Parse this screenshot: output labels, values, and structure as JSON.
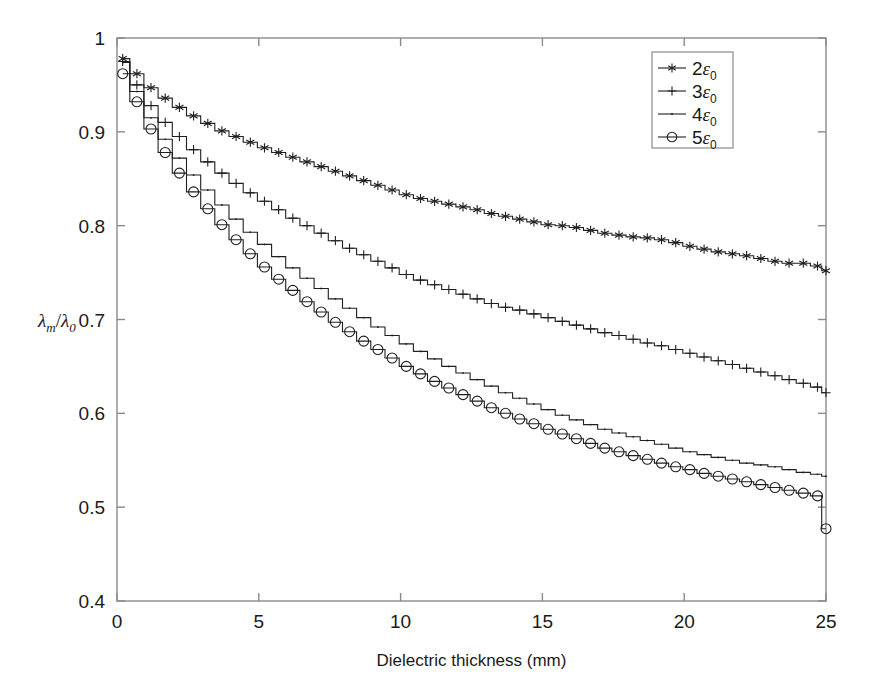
{
  "chart_data": {
    "type": "line",
    "title": "",
    "subtitle": "",
    "xlabel": "Dielectric thickness (mm)",
    "ylabel": "λₘ/λ₀",
    "ylabel_parts": {
      "lambda": "λ",
      "sub_m": "m",
      "slash": "/",
      "sub_0": "0"
    },
    "xlim": [
      0,
      25
    ],
    "ylim": [
      0.4,
      1.0
    ],
    "xticks": [
      0,
      5,
      10,
      15,
      20,
      25
    ],
    "xticklabels": [
      "0",
      "5",
      "10",
      "15",
      "20",
      "25"
    ],
    "yticks": [
      0.4,
      0.5,
      0.6,
      0.7,
      0.8,
      0.9,
      1.0
    ],
    "yticklabels": [
      "0.4",
      "0.5",
      "0.6",
      "0.7",
      "0.8",
      "0.9",
      "1"
    ],
    "grid": false,
    "legend_position": "top-right",
    "legend_entries": [
      {
        "label": "2ε0",
        "label_num": "2",
        "label_eps": "ε",
        "label_sub": "0",
        "marker": "asterisk",
        "color": "#1f1f1f"
      },
      {
        "label": "3ε0",
        "label_num": "3",
        "label_eps": "ε",
        "label_sub": "0",
        "marker": "plus",
        "color": "#1f1f1f"
      },
      {
        "label": "4ε0",
        "label_num": "4",
        "label_eps": "ε",
        "label_sub": "0",
        "marker": "dot",
        "color": "#1f1f1f"
      },
      {
        "label": "5ε0",
        "label_num": "5",
        "label_eps": "ε",
        "label_sub": "0",
        "marker": "circle",
        "color": "#1f1f1f"
      }
    ],
    "x": [
      0.2,
      0.7,
      1.2,
      1.7,
      2.2,
      2.7,
      3.2,
      3.7,
      4.2,
      4.7,
      5.2,
      5.7,
      6.2,
      6.7,
      7.2,
      7.7,
      8.2,
      8.7,
      9.2,
      9.7,
      10.2,
      10.7,
      11.2,
      11.7,
      12.2,
      12.7,
      13.2,
      13.7,
      14.2,
      14.7,
      15.2,
      15.7,
      16.2,
      16.7,
      17.2,
      17.7,
      18.2,
      18.7,
      19.2,
      19.7,
      20.2,
      20.7,
      21.2,
      21.7,
      22.2,
      22.7,
      23.2,
      23.7,
      24.2,
      24.7,
      25.0
    ],
    "series": [
      {
        "name": "2ε0",
        "marker": "asterisk",
        "values": [
          0.978,
          0.962,
          0.947,
          0.936,
          0.926,
          0.917,
          0.909,
          0.901,
          0.895,
          0.889,
          0.883,
          0.878,
          0.873,
          0.868,
          0.863,
          0.858,
          0.853,
          0.848,
          0.843,
          0.838,
          0.833,
          0.829,
          0.826,
          0.823,
          0.82,
          0.817,
          0.813,
          0.81,
          0.807,
          0.804,
          0.801,
          0.8,
          0.798,
          0.795,
          0.792,
          0.79,
          0.788,
          0.787,
          0.785,
          0.782,
          0.778,
          0.775,
          0.772,
          0.77,
          0.768,
          0.765,
          0.762,
          0.76,
          0.76,
          0.757,
          0.752
        ]
      },
      {
        "name": "3ε0",
        "marker": "plus",
        "values": [
          0.975,
          0.95,
          0.928,
          0.91,
          0.895,
          0.881,
          0.868,
          0.856,
          0.845,
          0.835,
          0.826,
          0.817,
          0.808,
          0.8,
          0.792,
          0.784,
          0.776,
          0.769,
          0.762,
          0.755,
          0.748,
          0.742,
          0.737,
          0.732,
          0.727,
          0.722,
          0.717,
          0.713,
          0.71,
          0.706,
          0.702,
          0.698,
          0.694,
          0.69,
          0.686,
          0.683,
          0.679,
          0.675,
          0.672,
          0.668,
          0.664,
          0.66,
          0.656,
          0.652,
          0.648,
          0.644,
          0.64,
          0.636,
          0.632,
          0.628,
          0.622
        ]
      },
      {
        "name": "4ε0",
        "marker": "dot",
        "values": [
          0.974,
          0.943,
          0.915,
          0.892,
          0.872,
          0.854,
          0.838,
          0.822,
          0.807,
          0.793,
          0.78,
          0.767,
          0.755,
          0.744,
          0.733,
          0.722,
          0.712,
          0.702,
          0.692,
          0.683,
          0.674,
          0.666,
          0.658,
          0.65,
          0.643,
          0.636,
          0.629,
          0.622,
          0.616,
          0.61,
          0.604,
          0.598,
          0.593,
          0.588,
          0.583,
          0.579,
          0.575,
          0.571,
          0.567,
          0.563,
          0.559,
          0.556,
          0.553,
          0.55,
          0.547,
          0.545,
          0.543,
          0.54,
          0.537,
          0.535,
          0.533
        ]
      },
      {
        "name": "5ε0",
        "marker": "circle",
        "values": [
          0.962,
          0.932,
          0.903,
          0.878,
          0.856,
          0.836,
          0.818,
          0.801,
          0.785,
          0.77,
          0.756,
          0.743,
          0.731,
          0.719,
          0.708,
          0.697,
          0.687,
          0.677,
          0.668,
          0.659,
          0.65,
          0.642,
          0.634,
          0.627,
          0.62,
          0.613,
          0.606,
          0.6,
          0.594,
          0.589,
          0.583,
          0.578,
          0.573,
          0.568,
          0.563,
          0.559,
          0.555,
          0.551,
          0.547,
          0.543,
          0.54,
          0.536,
          0.533,
          0.53,
          0.527,
          0.524,
          0.521,
          0.518,
          0.515,
          0.512,
          0.477
        ]
      }
    ]
  }
}
